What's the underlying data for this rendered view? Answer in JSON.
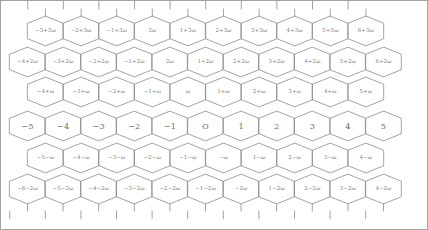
{
  "figure": {
    "name": "eisenstein-integer-hex-lattice",
    "width": 428,
    "height": 230,
    "background_color": "#ffffff",
    "line_color": "#8c8c8c",
    "label_color": "#7d7d7d",
    "border_color": "#9a9a9a",
    "symbol": "ω",
    "origin_label": "O"
  },
  "lattice": {
    "hex_width": 35.6,
    "row_height": 29.8,
    "rows": [
      {
        "index": 0,
        "y": 31,
        "x_start": 45.5,
        "emphasis": false,
        "cells": [
          {
            "label": "−3+3ω"
          },
          {
            "label": "−2+3ω"
          },
          {
            "label": "−1+3ω"
          },
          {
            "label": "3ω"
          },
          {
            "label": "1+3ω"
          },
          {
            "label": "2+3ω"
          },
          {
            "label": "3+3ω"
          },
          {
            "label": "4+3ω"
          },
          {
            "label": "5+3ω"
          },
          {
            "label": "6+3ω"
          }
        ]
      },
      {
        "index": 1,
        "y": 62,
        "x_start": 27.5,
        "emphasis": false,
        "cells": [
          {
            "label": "−4+2ω"
          },
          {
            "label": "−3+2ω"
          },
          {
            "label": "−2+2ω"
          },
          {
            "label": "−1+2ω"
          },
          {
            "label": "2ω"
          },
          {
            "label": "1+2ω"
          },
          {
            "label": "2+2ω"
          },
          {
            "label": "3+2ω"
          },
          {
            "label": "4+2ω"
          },
          {
            "label": "5+2ω"
          },
          {
            "label": "6+2ω"
          }
        ]
      },
      {
        "index": 2,
        "y": 92,
        "x_start": 45.5,
        "emphasis": false,
        "cells": [
          {
            "label": "−4+ω"
          },
          {
            "label": "−3+ω"
          },
          {
            "label": "−2+ω"
          },
          {
            "label": "−1+ω"
          },
          {
            "label": "ω"
          },
          {
            "label": "1+ω"
          },
          {
            "label": "2+ω"
          },
          {
            "label": "3+ω"
          },
          {
            "label": "4+ω"
          },
          {
            "label": "5+ω"
          }
        ]
      },
      {
        "index": 3,
        "y": 126,
        "x_start": 27.5,
        "emphasis": true,
        "cells": [
          {
            "label": "−5"
          },
          {
            "label": "−4"
          },
          {
            "label": "−3"
          },
          {
            "label": "−2"
          },
          {
            "label": "−1"
          },
          {
            "label": "O"
          },
          {
            "label": "1"
          },
          {
            "label": "2"
          },
          {
            "label": "3"
          },
          {
            "label": "4"
          },
          {
            "label": "5"
          }
        ]
      },
      {
        "index": 4,
        "y": 158,
        "x_start": 45.5,
        "emphasis": false,
        "cells": [
          {
            "label": "−5−ω"
          },
          {
            "label": "−4−ω"
          },
          {
            "label": "−3−ω"
          },
          {
            "label": "−2−ω"
          },
          {
            "label": "−1−ω"
          },
          {
            "label": "−ω"
          },
          {
            "label": "1−ω"
          },
          {
            "label": "2−ω"
          },
          {
            "label": "3−ω"
          },
          {
            "label": "4−ω"
          }
        ]
      },
      {
        "index": 5,
        "y": 189,
        "x_start": 27.5,
        "emphasis": false,
        "cells": [
          {
            "label": "−6−2ω"
          },
          {
            "label": "−5−2ω"
          },
          {
            "label": "−4−2ω"
          },
          {
            "label": "−3−2ω"
          },
          {
            "label": "−2−2ω"
          },
          {
            "label": "−1−2ω"
          },
          {
            "label": "−2ω"
          },
          {
            "label": "1−2ω"
          },
          {
            "label": "2−2ω"
          },
          {
            "label": "3−2ω"
          },
          {
            "label": "4−2ω"
          }
        ]
      }
    ]
  }
}
